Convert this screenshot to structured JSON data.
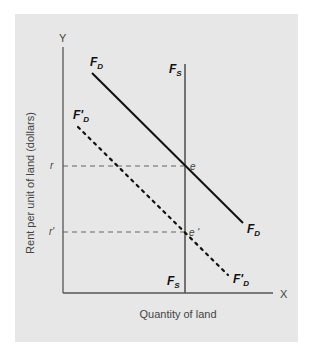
{
  "diagram": {
    "axes": {
      "y_letter": "Y",
      "x_letter": "X",
      "y_title": "Rent per unit of land (dollars)",
      "x_title": "Quantity of land"
    },
    "curves": {
      "demand": {
        "main": "F",
        "sub": "D"
      },
      "demand_shifted": {
        "main": "F'",
        "sub": "D"
      },
      "supply": {
        "main": "F",
        "sub": "S"
      }
    },
    "price_levels": {
      "r": "r",
      "r_prime": "r'"
    },
    "equilibria": {
      "e": "e",
      "e_prime": "e '"
    },
    "colors": {
      "panel": "#e7e7e7",
      "axis": "#555555",
      "curve": "#111111",
      "supply": "#555555"
    }
  }
}
